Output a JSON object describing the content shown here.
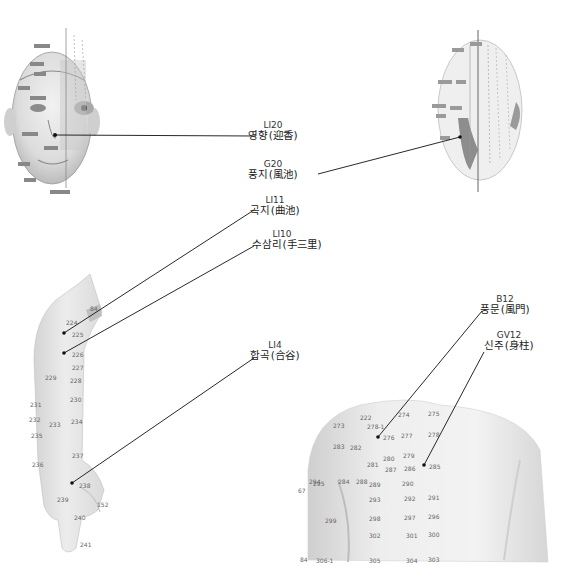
{
  "labels": [
    {
      "id": "LI20",
      "code": "LI20",
      "name": "영향(迎香)",
      "x": 268,
      "y": 121
    },
    {
      "id": "G20",
      "code": "G20",
      "name": "풍지(風池)",
      "x": 268,
      "y": 167
    },
    {
      "id": "LI11",
      "code": "LI11",
      "name": "곡지(曲池)",
      "x": 270,
      "y": 204
    },
    {
      "id": "LI10",
      "code": "LI10",
      "name": "수삼리(手三里)",
      "x": 279,
      "y": 236
    },
    {
      "id": "LI4",
      "code": "LI4",
      "name": "합곡(合谷)",
      "x": 265,
      "y": 343
    },
    {
      "id": "B12",
      "code": "B12",
      "name": "풍문(風門)",
      "x": 505,
      "y": 297
    },
    {
      "id": "GV12",
      "code": "GV12",
      "name": "신주(身柱)",
      "x": 510,
      "y": 333
    }
  ],
  "arm_points": [
    "84",
    "224",
    "225",
    "226",
    "227",
    "228",
    "229",
    "230",
    "231",
    "232",
    "233",
    "234",
    "235",
    "236",
    "237",
    "238",
    "239",
    "240",
    "241",
    "152"
  ],
  "back_points": [
    "222",
    "273",
    "274",
    "275",
    "276",
    "277",
    "278",
    "279",
    "280",
    "281",
    "282",
    "283",
    "284",
    "285",
    "286",
    "287",
    "288",
    "289",
    "290",
    "291",
    "292",
    "293",
    "294",
    "295",
    "296",
    "297",
    "298",
    "299",
    "300",
    "301",
    "302",
    "303",
    "304",
    "305",
    "306-1",
    "67",
    "84",
    "278-1"
  ],
  "figures": {
    "front_face": "front-face-acupoint-chart",
    "back_head": "back-of-head-acupoint-chart",
    "arm": "arm-acupoint-chart",
    "upper_back": "upper-back-acupoint-chart"
  },
  "colors": {
    "skin": "#e6e6e6",
    "skin_dark": "#b9b9b9",
    "line": "#111111",
    "point": "#777777"
  }
}
